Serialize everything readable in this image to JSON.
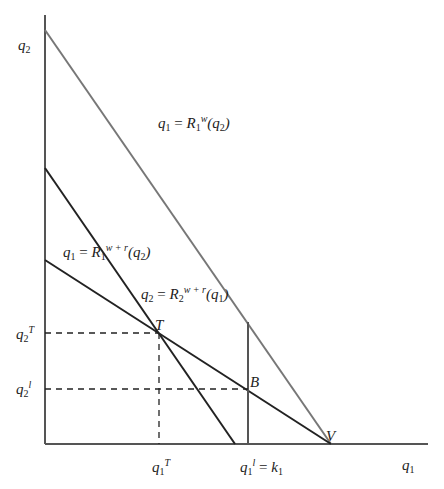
{
  "diagram": {
    "axes": {
      "y_label": {
        "base": "q",
        "sub": "2"
      },
      "x_label": {
        "base": "q",
        "sub": "1"
      }
    },
    "curves": [
      {
        "id": "R1w",
        "label": {
          "lhs": "q",
          "lhs_sub": "1",
          "eq": " = ",
          "fn": "R",
          "fn_sub": "1",
          "fn_sup": "w",
          "arg": "(q",
          "arg_sub": "2",
          "close": ")"
        },
        "color": "#777777"
      },
      {
        "id": "R1wr",
        "label": {
          "lhs": "q",
          "lhs_sub": "1",
          "eq": " = ",
          "fn": "R",
          "fn_sub": "1",
          "fn_sup": "w + r",
          "arg": "(q",
          "arg_sub": "2",
          "close": ")"
        },
        "color": "#222222"
      },
      {
        "id": "R2wr",
        "label": {
          "lhs": "q",
          "lhs_sub": "2",
          "eq": " = ",
          "fn": "R",
          "fn_sub": "2",
          "fn_sup": "w + r",
          "arg": "(q",
          "arg_sub": "1",
          "close": ")"
        },
        "color": "#222222"
      }
    ],
    "points": {
      "T": "T",
      "B": "B",
      "V": "V"
    },
    "y_ticks": [
      {
        "base": "q",
        "sub": "2",
        "sup": "T"
      },
      {
        "base": "q",
        "sub": "2",
        "sup": "l"
      }
    ],
    "x_ticks": [
      {
        "base": "q",
        "sub": "1",
        "sup": "T"
      },
      {
        "base": "q",
        "sub": "1",
        "sup": "l",
        "rhs": " = k",
        "rhs_sub": "1"
      }
    ]
  }
}
